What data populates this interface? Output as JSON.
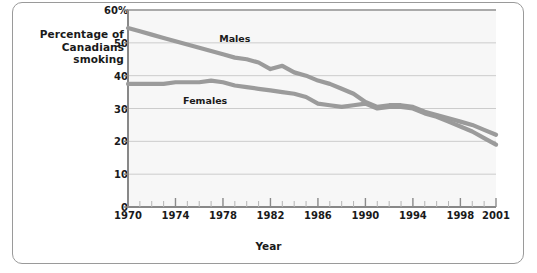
{
  "chart_data": {
    "type": "line",
    "title": "",
    "ylabel": "Percentage of Canadians smoking",
    "xlabel": "Year",
    "ylim": [
      0,
      60
    ],
    "xlim": [
      1970,
      2001
    ],
    "grid": true,
    "legend_position": "inline-labels",
    "y_ticks": [
      "0",
      "10",
      "20",
      "30",
      "40",
      "50",
      "60%"
    ],
    "y_tick_values": [
      0,
      10,
      20,
      30,
      40,
      50,
      60
    ],
    "x_ticks": [
      "1970",
      "1974",
      "1978",
      "1982",
      "1986",
      "1990",
      "1994",
      "1998",
      "2001"
    ],
    "x_tick_values": [
      1970,
      1974,
      1978,
      1982,
      1986,
      1990,
      1994,
      1998,
      2001
    ],
    "x_minor_tick_step": 1,
    "x": [
      1970,
      1971,
      1972,
      1973,
      1974,
      1975,
      1976,
      1977,
      1978,
      1979,
      1980,
      1981,
      1982,
      1983,
      1984,
      1985,
      1986,
      1987,
      1988,
      1989,
      1990,
      1991,
      1992,
      1993,
      1994,
      1995,
      1996,
      1997,
      1998,
      1999,
      2000,
      2001
    ],
    "series": [
      {
        "name": "Males",
        "color": "#9b9b9b",
        "values": [
          54.5,
          53.5,
          52.5,
          51.5,
          50.5,
          49.5,
          48.5,
          47.5,
          46.5,
          45.5,
          45.0,
          44.0,
          42.0,
          43.0,
          41.0,
          40.0,
          38.5,
          37.5,
          36.0,
          34.5,
          32.0,
          30.5,
          31.0,
          31.0,
          30.5,
          29.0,
          28.0,
          27.0,
          26.0,
          25.0,
          23.5,
          22.0
        ]
      },
      {
        "name": "Females",
        "color": "#9b9b9b",
        "values": [
          37.5,
          37.5,
          37.5,
          37.5,
          38.0,
          38.0,
          38.0,
          38.5,
          38.0,
          37.0,
          36.5,
          36.0,
          35.5,
          35.0,
          34.5,
          33.5,
          31.5,
          31.0,
          30.5,
          31.0,
          31.5,
          30.0,
          30.5,
          30.5,
          30.0,
          28.5,
          27.5,
          26.0,
          24.5,
          23.0,
          21.0,
          19.0
        ]
      }
    ],
    "annotations": [
      {
        "text": "Males",
        "x": 1979.0,
        "y": 51.5
      },
      {
        "text": "Females",
        "x": 1976.5,
        "y": 32.5
      }
    ],
    "colors": {
      "line": "#9b9b9b",
      "gridline": "#cccccc",
      "axis": "#888888",
      "plot_background": "#f7f7f7",
      "frame_border": "#9a9a9a",
      "text": "#1a1a1a"
    }
  }
}
